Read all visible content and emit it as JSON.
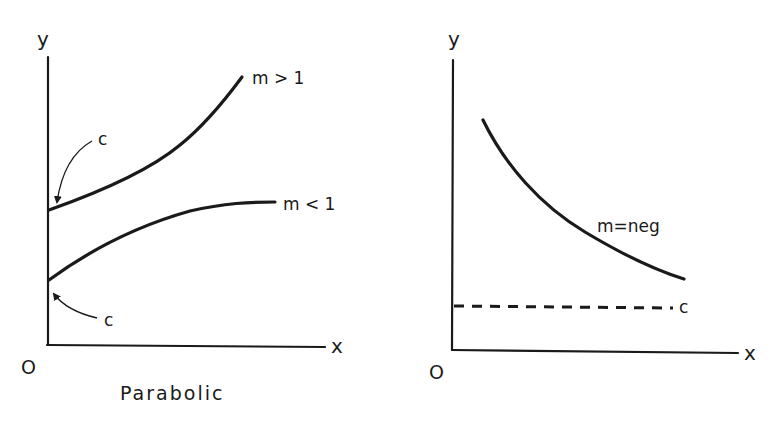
{
  "figure": {
    "left_panel": {
      "caption": "Parabolic",
      "y_axis_label": "y",
      "x_axis_label": "x",
      "origin_label": "O",
      "curves": [
        {
          "id": "m-gt-1",
          "label": "m > 1",
          "shape": "concave-up increasing"
        },
        {
          "id": "m-lt-1",
          "label": "m < 1",
          "shape": "concave-down increasing"
        }
      ],
      "intercept_labels": [
        {
          "target": "m-gt-1",
          "label": "c"
        },
        {
          "target": "m-lt-1",
          "label": "c"
        }
      ]
    },
    "right_panel": {
      "y_axis_label": "y",
      "x_axis_label": "x",
      "origin_label": "O",
      "curves": [
        {
          "id": "m-neg",
          "label": "m=neg",
          "shape": "decreasing, asymptotic to c"
        }
      ],
      "asymptote": {
        "label": "c",
        "style": "dashed"
      }
    }
  }
}
